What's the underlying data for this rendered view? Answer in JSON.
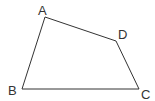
{
  "diagram": {
    "type": "quadrilateral",
    "stroke_color": "#333333",
    "background": "#ffffff",
    "vertices": [
      {
        "name": "A",
        "label": "A",
        "x": 45,
        "y": 17,
        "label_x": 38,
        "label_y": 15
      },
      {
        "name": "D",
        "label": "D",
        "x": 116,
        "y": 41,
        "label_x": 118,
        "label_y": 39
      },
      {
        "name": "C",
        "label": "C",
        "x": 139,
        "y": 89,
        "label_x": 141,
        "label_y": 99
      },
      {
        "name": "B",
        "label": "B",
        "x": 22,
        "y": 89,
        "label_x": 8,
        "label_y": 95
      }
    ],
    "edges": [
      [
        "A",
        "D"
      ],
      [
        "D",
        "C"
      ],
      [
        "C",
        "B"
      ],
      [
        "B",
        "A"
      ]
    ]
  }
}
